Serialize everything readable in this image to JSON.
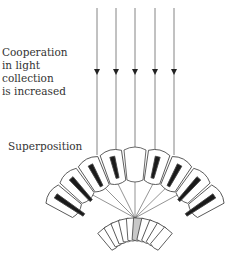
{
  "labels": {
    "cooperation": [
      "Cooperation",
      "in light",
      "collection",
      "is increased"
    ],
    "superposition": "Superposition"
  },
  "diagram": {
    "type": "superposition compound eye",
    "incoming_rays": 5,
    "outer_ommatidia": 9,
    "receptor_units": 10,
    "highlighted_receptor_color": "#c8c8c8",
    "pigment_color": "#1a1a1a",
    "line_color": "#555555"
  }
}
